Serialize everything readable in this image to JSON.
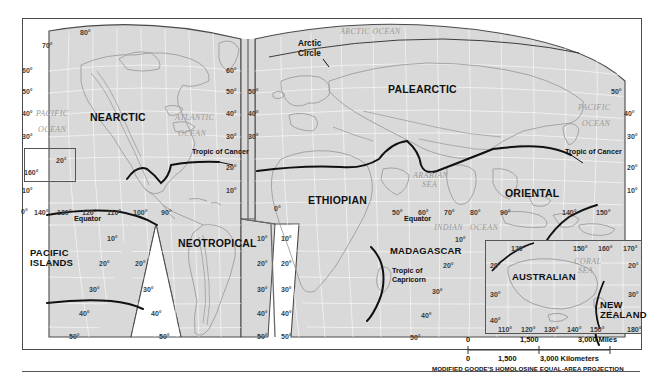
{
  "map": {
    "title": "World map of biogeographic realms",
    "projection_note": "MODIFIED GOODE'S HOMOLOSINE EQUAL-AREA PROJECTION",
    "realms": [
      {
        "name": "NEARCTIC",
        "x": 90,
        "y": 112
      },
      {
        "name": "NEOTROPICAL",
        "x": 178,
        "y": 238
      },
      {
        "name": "PACIFIC\nISLANDS",
        "x": 30,
        "y": 248
      },
      {
        "name": "PALEARCTIC",
        "x": 388,
        "y": 84
      },
      {
        "name": "ETHIOPIAN",
        "x": 308,
        "y": 195
      },
      {
        "name": "ORIENTAL",
        "x": 505,
        "y": 188
      },
      {
        "name": "MADAGASCAR",
        "x": 390,
        "y": 246
      },
      {
        "name": "AUSTRALIAN",
        "x": 512,
        "y": 272
      },
      {
        "name": "NEW\nZEALAND",
        "x": 600,
        "y": 300
      }
    ],
    "oceans": [
      {
        "name": "PACIFIC",
        "x": 36,
        "y": 110
      },
      {
        "name": "OCEAN",
        "x": 38,
        "y": 126
      },
      {
        "name": "ATLANTIC",
        "x": 175,
        "y": 114
      },
      {
        "name": "OCEAN",
        "x": 178,
        "y": 130
      },
      {
        "name": "ARCTIC OCEAN",
        "x": 340,
        "y": 28
      },
      {
        "name": "PACIFIC",
        "x": 578,
        "y": 104
      },
      {
        "name": "OCEAN",
        "x": 582,
        "y": 120
      },
      {
        "name": "ARABIAN",
        "x": 413,
        "y": 172
      },
      {
        "name": "SEA",
        "x": 422,
        "y": 181
      },
      {
        "name": "INDIAN",
        "x": 434,
        "y": 224
      },
      {
        "name": "OCEAN",
        "x": 470,
        "y": 224
      },
      {
        "name": "CORAL",
        "x": 574,
        "y": 258
      },
      {
        "name": "SEA",
        "x": 578,
        "y": 267
      }
    ],
    "annotations": [
      {
        "name": "Arctic",
        "x": 298,
        "y": 40
      },
      {
        "name": "Circle",
        "x": 298,
        "y": 50
      },
      {
        "name": "Tropic of Cancer",
        "x": 192,
        "y": 148
      },
      {
        "name": "Tropic of Cancer",
        "x": 565,
        "y": 148
      },
      {
        "name": "Equator",
        "x": 74,
        "y": 215
      },
      {
        "name": "Equator",
        "x": 404,
        "y": 215
      },
      {
        "name": "Tropic of",
        "x": 392,
        "y": 267
      },
      {
        "name": "Capricorn",
        "x": 392,
        "y": 276
      }
    ],
    "graticule_labels": [
      {
        "text": "80°",
        "x": 80,
        "y": 29
      },
      {
        "text": "70°",
        "x": 42,
        "y": 42
      },
      {
        "text": "60°",
        "x": 22,
        "y": 67
      },
      {
        "text": "50°",
        "x": 22,
        "y": 88
      },
      {
        "text": "40°",
        "x": 22,
        "y": 110
      },
      {
        "text": "30°",
        "x": 22,
        "y": 133
      },
      {
        "text": "10°",
        "x": 22,
        "y": 187
      },
      {
        "text": "0°",
        "x": 21,
        "y": 208
      },
      {
        "text": "160°",
        "x": 24,
        "y": 169
      },
      {
        "text": "20°",
        "x": 56,
        "y": 157
      },
      {
        "text": "140°",
        "x": 34,
        "y": 209
      },
      {
        "text": "130°",
        "x": 57,
        "y": 209
      },
      {
        "text": "120°",
        "x": 82,
        "y": 209
      },
      {
        "text": "110°",
        "x": 107,
        "y": 209
      },
      {
        "text": "100°",
        "x": 133,
        "y": 209
      },
      {
        "text": "90°",
        "x": 161,
        "y": 209
      },
      {
        "text": "10°",
        "x": 107,
        "y": 235
      },
      {
        "text": "20°",
        "x": 99,
        "y": 260
      },
      {
        "text": "30°",
        "x": 89,
        "y": 286
      },
      {
        "text": "40°",
        "x": 79,
        "y": 310
      },
      {
        "text": "50°",
        "x": 69,
        "y": 333
      },
      {
        "text": "20°",
        "x": 135,
        "y": 260
      },
      {
        "text": "30°",
        "x": 143,
        "y": 286
      },
      {
        "text": "40°",
        "x": 151,
        "y": 310
      },
      {
        "text": "50°",
        "x": 159,
        "y": 333
      },
      {
        "text": "60°",
        "x": 226,
        "y": 67
      },
      {
        "text": "50°",
        "x": 226,
        "y": 88
      },
      {
        "text": "40°",
        "x": 226,
        "y": 110
      },
      {
        "text": "30°",
        "x": 226,
        "y": 133
      },
      {
        "text": "20°",
        "x": 226,
        "y": 164
      },
      {
        "text": "10°",
        "x": 226,
        "y": 187
      },
      {
        "text": "10°",
        "x": 257,
        "y": 235
      },
      {
        "text": "20°",
        "x": 257,
        "y": 260
      },
      {
        "text": "30°",
        "x": 257,
        "y": 286
      },
      {
        "text": "40°",
        "x": 257,
        "y": 310
      },
      {
        "text": "50°",
        "x": 257,
        "y": 333
      },
      {
        "text": "50°",
        "x": 248,
        "y": 88
      },
      {
        "text": "40°",
        "x": 248,
        "y": 110
      },
      {
        "text": "30°",
        "x": 248,
        "y": 133
      },
      {
        "text": "0°",
        "x": 274,
        "y": 205
      },
      {
        "text": "10°",
        "x": 281,
        "y": 235
      },
      {
        "text": "20°",
        "x": 281,
        "y": 260
      },
      {
        "text": "30°",
        "x": 281,
        "y": 286
      },
      {
        "text": "40°",
        "x": 281,
        "y": 310
      },
      {
        "text": "50°",
        "x": 281,
        "y": 333
      },
      {
        "text": "50°",
        "x": 392,
        "y": 209
      },
      {
        "text": "60°",
        "x": 418,
        "y": 209
      },
      {
        "text": "70°",
        "x": 444,
        "y": 209
      },
      {
        "text": "80°",
        "x": 470,
        "y": 209
      },
      {
        "text": "90°",
        "x": 500,
        "y": 209
      },
      {
        "text": "10°",
        "x": 455,
        "y": 236
      },
      {
        "text": "20°",
        "x": 443,
        "y": 262
      },
      {
        "text": "30°",
        "x": 432,
        "y": 288
      },
      {
        "text": "40°",
        "x": 421,
        "y": 312
      },
      {
        "text": "50°",
        "x": 410,
        "y": 334
      },
      {
        "text": "140°",
        "x": 562,
        "y": 209
      },
      {
        "text": "150°",
        "x": 596,
        "y": 209
      },
      {
        "text": "50°",
        "x": 611,
        "y": 88
      },
      {
        "text": "40°",
        "x": 624,
        "y": 110
      },
      {
        "text": "30°",
        "x": 627,
        "y": 133
      },
      {
        "text": "20°",
        "x": 627,
        "y": 164
      },
      {
        "text": "10°",
        "x": 627,
        "y": 187
      }
    ],
    "inset_australian": {
      "labels": [
        {
          "text": "120°",
          "x": 511,
          "y": 245
        },
        {
          "text": "150°",
          "x": 573,
          "y": 245
        },
        {
          "text": "160°",
          "x": 598,
          "y": 245
        },
        {
          "text": "170°",
          "x": 623,
          "y": 245
        },
        {
          "text": "20°",
          "x": 490,
          "y": 262
        },
        {
          "text": "30°",
          "x": 490,
          "y": 291
        },
        {
          "text": "40°",
          "x": 490,
          "y": 317
        },
        {
          "text": "20°",
          "x": 628,
          "y": 262
        },
        {
          "text": "30°",
          "x": 628,
          "y": 291
        },
        {
          "text": "110°",
          "x": 498,
          "y": 326
        },
        {
          "text": "120°",
          "x": 521,
          "y": 326
        },
        {
          "text": "130°",
          "x": 544,
          "y": 326
        },
        {
          "text": "140°",
          "x": 567,
          "y": 326
        },
        {
          "text": "150°",
          "x": 590,
          "y": 326
        },
        {
          "text": "180°",
          "x": 627,
          "y": 326
        }
      ]
    },
    "scale": {
      "miles": {
        "start": "0",
        "mid": "1,500",
        "end": "3,000 Miles"
      },
      "kilometers": {
        "start": "0",
        "mid": "1,500",
        "end": "3,000 Kilometers"
      }
    }
  }
}
